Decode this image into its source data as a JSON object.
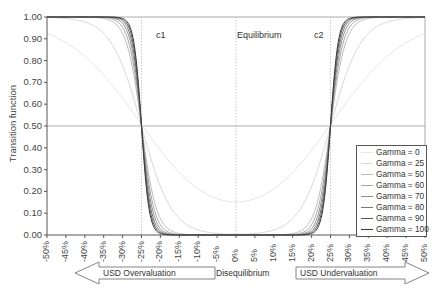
{
  "chart_data": {
    "type": "line",
    "title": "",
    "xlabel": "Disequilibrium",
    "ylabel": "Transition function",
    "xlim": [
      -0.5,
      0.5
    ],
    "ylim": [
      0,
      1
    ],
    "x_ticks": [
      "-50%",
      "-45%",
      "-40%",
      "-35%",
      "-30%",
      "-25%",
      "-20%",
      "-15%",
      "-10%",
      "-5%",
      "0%",
      "5%",
      "10%",
      "15%",
      "20%",
      "25%",
      "30%",
      "35%",
      "40%",
      "45%",
      "50%"
    ],
    "y_ticks": [
      "0.00",
      "0.10",
      "0.20",
      "0.30",
      "0.40",
      "0.50",
      "0.60",
      "0.70",
      "0.80",
      "0.90",
      "1.00"
    ],
    "grid": false,
    "annotations": [
      {
        "text": "c1",
        "x": -0.25
      },
      {
        "text": "Equilibrium",
        "x": 0
      },
      {
        "text": "c2",
        "x": 0.25
      }
    ],
    "reference_lines": {
      "vertical": [
        -0.25,
        0,
        0.25
      ],
      "horizontal": [
        0.5
      ]
    },
    "legend_position": "lower right",
    "function": "double logistic: 1 - 1/(1+exp(-g*(x-c1))) + 1/(1+exp(-g*(x-c2))), c1=-25%, c2=25%",
    "series": [
      {
        "name": "Gamma = 0",
        "gamma": 10,
        "color": "#e4e4e4"
      },
      {
        "name": "Gamma = 25",
        "gamma": 25,
        "color": "#d8d8d8"
      },
      {
        "name": "Gamma = 50",
        "gamma": 50,
        "color": "#bcbcbc"
      },
      {
        "name": "Gamma = 60",
        "gamma": 60,
        "color": "#a8a8a8"
      },
      {
        "name": "Gamma = 70",
        "gamma": 70,
        "color": "#909090"
      },
      {
        "name": "Gamma = 80",
        "gamma": 80,
        "color": "#787878"
      },
      {
        "name": "Gamma = 90",
        "gamma": 90,
        "color": "#5a5a5a"
      },
      {
        "name": "Gamma = 100",
        "gamma": 100,
        "color": "#3a3a3a"
      }
    ],
    "sample_values": {
      "x": [
        -0.5,
        -0.4,
        -0.3,
        -0.25,
        -0.2,
        -0.1,
        0,
        0.1,
        0.2,
        0.25,
        0.3,
        0.4,
        0.5
      ],
      "Gamma = 100": [
        1.0,
        1.0,
        0.99,
        0.5,
        0.01,
        0.0,
        0.0,
        0.0,
        0.01,
        0.5,
        0.99,
        1.0,
        1.0
      ],
      "Gamma = 25": [
        1.0,
        0.98,
        0.78,
        0.5,
        0.22,
        0.02,
        0.0,
        0.02,
        0.22,
        0.5,
        0.78,
        0.98,
        1.0
      ]
    }
  },
  "labels": {
    "c1": "c1",
    "equilibrium": "Equilibrium",
    "c2": "c2",
    "ylabel": "Transition function",
    "xlabel": "Disequilibrium",
    "left_arrow": "USD Overvaluation",
    "right_arrow": "USD Undervaluation"
  }
}
